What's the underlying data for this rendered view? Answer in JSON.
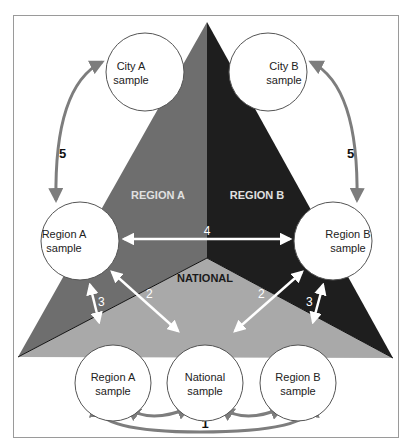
{
  "diagram": {
    "colors": {
      "frame": "#9a9a9a",
      "region_a": "#6e6e6e",
      "region_b": "#1e1e1e",
      "national": "#a9a9a9",
      "circle_fill": "#ffffff",
      "circle_stroke": "#555555",
      "grey_arrow": "#7d7d7d",
      "white_arrow": "#ffffff"
    },
    "areas": {
      "region_a": "REGION A",
      "region_b": "REGION B",
      "national": "NATIONAL"
    },
    "nodes": {
      "city_a": {
        "line1": "City A",
        "line2": "sample"
      },
      "city_b": {
        "line1": "City B",
        "line2": "sample"
      },
      "region_a_upper": {
        "line1": "Region A",
        "line2": "sample"
      },
      "region_b_upper": {
        "line1": "Region B",
        "line2": "sample"
      },
      "region_a_lower": {
        "line1": "Region A",
        "line2": "sample"
      },
      "national_lower": {
        "line1": "National",
        "line2": "sample"
      },
      "region_b_lower": {
        "line1": "Region B",
        "line2": "sample"
      }
    },
    "edge_labels": {
      "one": "1",
      "two_left": "2",
      "two_right": "2",
      "three_left": "3",
      "three_right": "3",
      "four": "4",
      "five_left": "5",
      "five_right": "5"
    }
  }
}
